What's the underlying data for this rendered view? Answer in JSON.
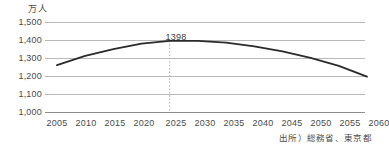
{
  "chart_data": {
    "type": "line",
    "title": "",
    "subtitle": "",
    "xlabel": "",
    "ylabel": "万人",
    "unit_label": "万人",
    "grid": true,
    "legend": false,
    "xlim": [
      2005,
      2060
    ],
    "ylim": [
      1000,
      1500
    ],
    "ytick_labels": [
      "1,500",
      "1,400",
      "1,300",
      "1,200",
      "1,100",
      "1,000"
    ],
    "ytick_values": [
      1500,
      1400,
      1300,
      1200,
      1100,
      1000
    ],
    "xtick_labels": [
      "2005",
      "2010",
      "2015",
      "2020",
      "2025",
      "2030",
      "2035",
      "2040",
      "2045",
      "2050",
      "2055",
      "2060"
    ],
    "categories": [
      2005,
      2010,
      2015,
      2020,
      2025,
      2030,
      2035,
      2040,
      2045,
      2050,
      2055,
      2060
    ],
    "values": [
      1265,
      1316,
      1352,
      1382,
      1398,
      1398,
      1388,
      1368,
      1340,
      1305,
      1262,
      1203
    ],
    "series": [
      {
        "name": "東京都人口",
        "color": "#2b2b2b",
        "values": [
          1265,
          1316,
          1352,
          1382,
          1398,
          1398,
          1388,
          1368,
          1340,
          1305,
          1262,
          1203
        ]
      }
    ],
    "annotations": [
      {
        "name": "peak-value-label",
        "text": "1398",
        "x": 2025,
        "y": 1398,
        "marker": "dotted-vertical-line"
      }
    ],
    "colors": {
      "line": "#2b2b2b",
      "gridline": "#b9b9b9",
      "axis": "#8d8d8d",
      "text": "#4a4a4a",
      "annotation_line": "#b0b0b0"
    }
  },
  "footer": {
    "source": "出所）総務省、東京都"
  }
}
